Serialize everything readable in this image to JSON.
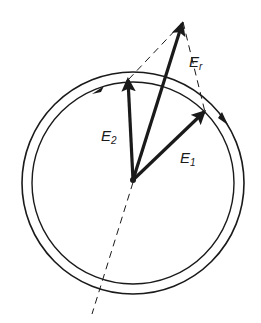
{
  "diagram": {
    "type": "phasor-vector-diagram",
    "colors": {
      "stroke": "#1a1a1a",
      "background": "#ffffff"
    },
    "vectors": [
      {
        "id": "E1",
        "label": "E",
        "subscript": "1"
      },
      {
        "id": "E2",
        "label": "E",
        "subscript": "2"
      },
      {
        "id": "Er",
        "label": "E",
        "subscript": "r"
      }
    ],
    "rings": [
      {
        "id": "outer",
        "arrow_direction": "clockwise"
      },
      {
        "id": "inner",
        "arrow_direction": "counter-clockwise"
      }
    ]
  }
}
